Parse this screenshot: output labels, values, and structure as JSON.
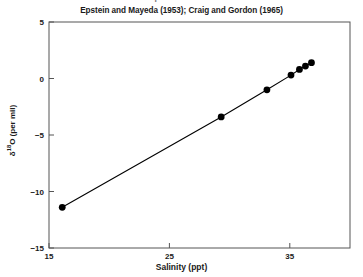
{
  "figure": {
    "clipped_header_text": "Isotopic Ratio of Water",
    "title": "Epstein and Mayeda (1953); Craig and Gordon (1965)",
    "xaxis_title": "Salinity (ppt)",
    "yaxis_title_prefix": "δ",
    "yaxis_title_sup": "18",
    "yaxis_title_suffix": "O (per mil)",
    "line_color": "#000000",
    "marker_color": "#000000",
    "axis_color": "#4d4d4d",
    "background_color": "#ffffff"
  },
  "chart_data": {
    "type": "scatter",
    "title": "Epstein and Mayeda (1953); Craig and Gordon (1965)",
    "xlabel": "Salinity (ppt)",
    "ylabel": "δ18O (per mil)",
    "xlim": [
      15,
      40
    ],
    "ylim": [
      -15,
      5
    ],
    "xticks": [
      15,
      25,
      35
    ],
    "yticks": [
      5,
      0,
      -5,
      -10,
      -15
    ],
    "xtick_labels": [
      "15",
      "25",
      "35"
    ],
    "ytick_labels": [
      "5",
      "0",
      "-5",
      "-10",
      "-15"
    ],
    "grid": false,
    "legend": null,
    "series": [
      {
        "name": "Seawater mixing line",
        "x": [
          16.1,
          29.3,
          33.1,
          35.1,
          35.8,
          36.3,
          36.8
        ],
        "y": [
          -11.4,
          -3.4,
          -1.0,
          0.3,
          0.8,
          1.1,
          1.4
        ],
        "marker": "filled-circle",
        "line": "solid"
      }
    ]
  }
}
